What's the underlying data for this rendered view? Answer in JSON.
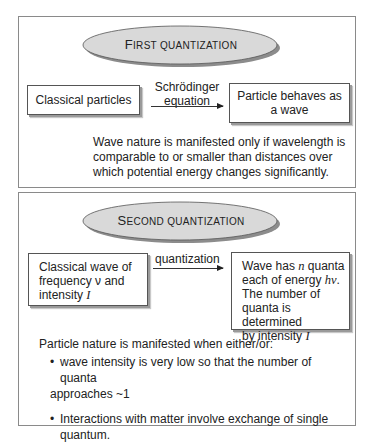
{
  "first_quantization": {
    "title_cap": "F",
    "title_rest": "IRST QUANTIZATION",
    "source_box": "Classical particles",
    "arrow_label_line1": "Schrödinger",
    "arrow_label_line2": "equation",
    "target_box_line1": "Particle behaves as",
    "target_box_line2": "a wave",
    "note_lines": [
      "Wave nature is manifested only if wavelength is",
      "comparable to or smaller than distances over",
      "which potential energy changes significantly."
    ]
  },
  "second_quantization": {
    "title_cap": "S",
    "title_rest": "ECOND QUANTIZATION",
    "source_box": {
      "line1": "Classical wave of",
      "line2_pre": "frequency ",
      "line2_var": "ν",
      "line2_post": " and",
      "line3_pre": "intensity ",
      "line3_var": "I"
    },
    "arrow_label": "quantization",
    "target_box": {
      "line1_pre": "Wave has ",
      "line1_var": "n",
      "line1_post": " quanta",
      "line2_pre": "each of energy ",
      "line2_var": "hν",
      "line2_post": ".",
      "line3": "The number of",
      "line4": "quanta is determined",
      "line5_pre": "by intensity ",
      "line5_var": "I"
    },
    "note_intro": "Particle nature is manifested when either/or:",
    "bullets": [
      {
        "line1": "wave intensity is very low so that the number of quanta",
        "line2": "approaches ~1"
      },
      {
        "line1": "Interactions with matter involve exchange of single quantum."
      }
    ],
    "bullet_glyph": "•"
  },
  "colors": {
    "panel_border": "#8a8a8a",
    "ellipse_fill": "#d9d9d9",
    "ellipse_shadow": "#8c8c8c",
    "box_border": "#555555",
    "text": "#222222"
  }
}
